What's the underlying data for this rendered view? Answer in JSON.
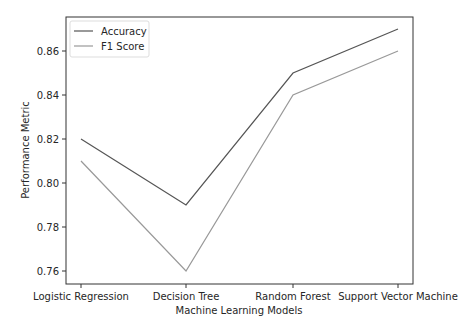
{
  "chart_data": {
    "type": "line",
    "title": "",
    "xlabel": "Machine Learning Models",
    "ylabel": "Performance Metric",
    "categories": [
      "Logistic Regression",
      "Decision Tree",
      "Random Forest",
      "Support Vector Machine"
    ],
    "series": [
      {
        "name": "Accuracy",
        "values": [
          0.82,
          0.79,
          0.85,
          0.87
        ],
        "color": "#555555"
      },
      {
        "name": "F1 Score",
        "values": [
          0.81,
          0.76,
          0.84,
          0.86
        ],
        "color": "#999999"
      }
    ],
    "yticks": [
      "0.76",
      "0.78",
      "0.80",
      "0.82",
      "0.84",
      "0.86"
    ],
    "ylim": [
      0.7535,
      0.8765
    ],
    "grid": false,
    "legend_position": "upper left"
  }
}
